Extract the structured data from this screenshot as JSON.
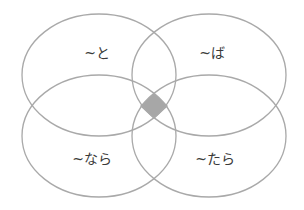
{
  "diagram": {
    "type": "venn",
    "sets": [
      {
        "id": "to",
        "label": "~と",
        "position": "top-left"
      },
      {
        "id": "ba",
        "label": "~ば",
        "position": "top-right"
      },
      {
        "id": "nara",
        "label": "~なら",
        "position": "bottom-left"
      },
      {
        "id": "tara",
        "label": "~たら",
        "position": "bottom-right"
      }
    ],
    "highlight": {
      "region": "intersection of all four sets"
    },
    "colors": {
      "outline": "#a9a9a9",
      "highlight": "#a7a7a7",
      "text": "#3a3a3a",
      "background": "#ffffff"
    }
  }
}
